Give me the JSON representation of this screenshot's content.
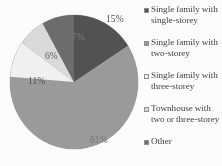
{
  "chart_data": {
    "type": "pie",
    "title": "",
    "legend_position": "right",
    "categories": [
      "Single family with single-storey",
      "Single family with two-storey",
      "Single family with three-storey",
      "Townhouse with two or three-storey",
      "Other"
    ],
    "values": [
      15,
      61,
      11,
      6,
      7
    ],
    "labels": [
      "15%",
      "61%",
      "11%",
      "6%",
      "7%"
    ],
    "colors": [
      "#4f4f4f",
      "#9a9a9a",
      "#f2f2f2",
      "#dcdcdc",
      "#6a6a6a"
    ],
    "xlabel": "",
    "ylabel": ""
  },
  "legend": {
    "items": [
      {
        "label": "Single family with single-storey",
        "color": "#4f4f4f"
      },
      {
        "label": "Single family with two-storey",
        "color": "#9a9a9a"
      },
      {
        "label": "Single family with three-storey",
        "color": "#f2f2f2"
      },
      {
        "label": "Townhouse with two or three-storey",
        "color": "#dcdcdc"
      },
      {
        "label": "Other",
        "color": "#6a6a6a"
      }
    ]
  },
  "slices": {
    "s0": "15%",
    "s1": "61%",
    "s2": "11%",
    "s3": "6%",
    "s4": "7%"
  }
}
